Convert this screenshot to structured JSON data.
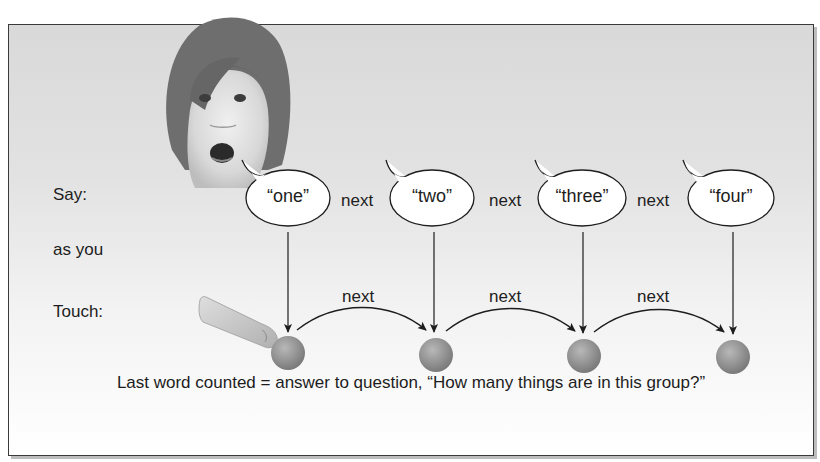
{
  "diagram": {
    "row_labels": {
      "say": "Say:",
      "as_you": "as you",
      "touch": "Touch:"
    },
    "spoken_words": [
      {
        "label": "“one”"
      },
      {
        "label": "“two”"
      },
      {
        "label": "“three”"
      },
      {
        "label": "“four”"
      }
    ],
    "say_next_labels": [
      "next",
      "next",
      "next"
    ],
    "touch_next_labels": [
      "next",
      "next",
      "next"
    ],
    "object_count": 4,
    "caption": "Last word counted = answer to question, “How many things are in this group?”",
    "colors": {
      "frame_border": "#3a3a3a",
      "background_top": "#d9d9d9",
      "background_bottom": "#ffffff",
      "sphere": "#8f8f8f",
      "bubble_fill": "#ffffff",
      "line": "#1d1d1d"
    }
  }
}
